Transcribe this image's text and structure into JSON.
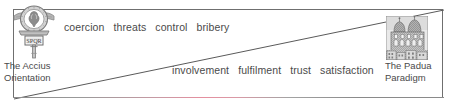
{
  "figure": {
    "frame": {
      "border_color": "#6f6f6f",
      "background": "#ffffff"
    },
    "diagonal": {
      "name": "diagonal-divider",
      "color": "#5a5a5a",
      "from": "bottom-left",
      "to": "top-right"
    },
    "bottom_accent": {
      "name": "bottom-accent-line",
      "color": "#e58f9f"
    }
  },
  "coercive": {
    "words": [
      "coercion",
      "threats",
      "control",
      "bribery"
    ]
  },
  "cooperative": {
    "words": [
      "involvement",
      "fulfilment",
      "trust",
      "satisfaction"
    ]
  },
  "left_pole": {
    "emblem_name": "roman-standard-emblem",
    "emblem_inscription": "SPQR",
    "caption_line1": "The Accius",
    "caption_line2": "Orientation"
  },
  "right_pole": {
    "emblem_name": "padua-buildings-engraving",
    "caption_line1": "The Padua",
    "caption_line2": "Paradigm"
  }
}
